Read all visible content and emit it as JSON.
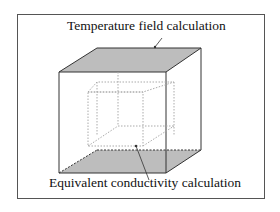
{
  "labels": {
    "top": "Temperature field calculation",
    "bottom": "Equivalent conductivity calculation"
  },
  "colors": {
    "face_fill": "#bdbdbd",
    "edge": "#333333",
    "inner_edge": "#aaaaaa",
    "frame": "#555555"
  }
}
